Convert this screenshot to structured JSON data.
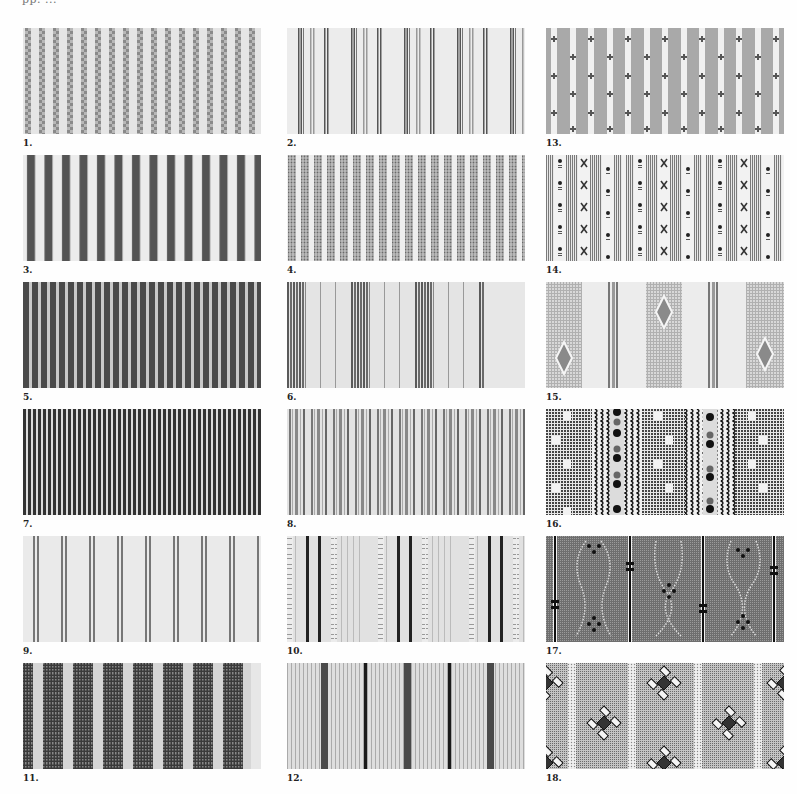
{
  "header": {
    "text": "pp. ..."
  },
  "swatches": [
    {
      "id": "1",
      "label": "1.",
      "pattern": "fine-checker-stripes"
    },
    {
      "id": "2",
      "label": "2.",
      "pattern": "grouped-thin-lines"
    },
    {
      "id": "13",
      "label": "13.",
      "pattern": "grey-bands-with-cross-motifs"
    },
    {
      "id": "3",
      "label": "3.",
      "pattern": "bold-dark-stripes"
    },
    {
      "id": "4",
      "label": "4.",
      "pattern": "dotted-grey-stripes"
    },
    {
      "id": "14",
      "label": "14.",
      "pattern": "lined-bands-with-dot-and-x-motifs"
    },
    {
      "id": "5",
      "label": "5.",
      "pattern": "dense-dark-stripes"
    },
    {
      "id": "6",
      "label": "6.",
      "pattern": "grouped-dark-bands"
    },
    {
      "id": "15",
      "label": "15.",
      "pattern": "grid-bands-with-diamonds"
    },
    {
      "id": "7",
      "label": "7.",
      "pattern": "very-fine-dark-stripes"
    },
    {
      "id": "8",
      "label": "8.",
      "pattern": "mixed-grey-stripes"
    },
    {
      "id": "16",
      "label": "16.",
      "pattern": "grid-with-wavy-lines-and-dots"
    },
    {
      "id": "9",
      "label": "9.",
      "pattern": "sparse-double-lines"
    },
    {
      "id": "10",
      "label": "10.",
      "pattern": "twisted-cord-stripes"
    },
    {
      "id": "17",
      "label": "17.",
      "pattern": "dark-field-with-chain-motifs"
    },
    {
      "id": "11",
      "label": "11.",
      "pattern": "wide-textured-dark-stripes"
    },
    {
      "id": "12",
      "label": "12.",
      "pattern": "fine-stripes-with-dark-accents"
    },
    {
      "id": "18",
      "label": "18.",
      "pattern": "dotted-field-with-diamond-flowers"
    }
  ]
}
